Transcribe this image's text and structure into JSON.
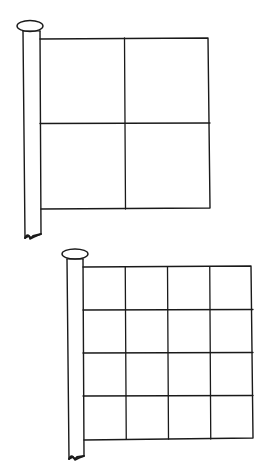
{
  "figure": {
    "ink_color": "#1a1a1a",
    "background_color": "#ffffff"
  },
  "flags": [
    {
      "id": "flag-2x2",
      "grid_rows": 2,
      "grid_cols": 2,
      "cell_count": 4
    },
    {
      "id": "flag-4x4",
      "grid_rows": 4,
      "grid_cols": 4,
      "cell_count": 16
    }
  ]
}
